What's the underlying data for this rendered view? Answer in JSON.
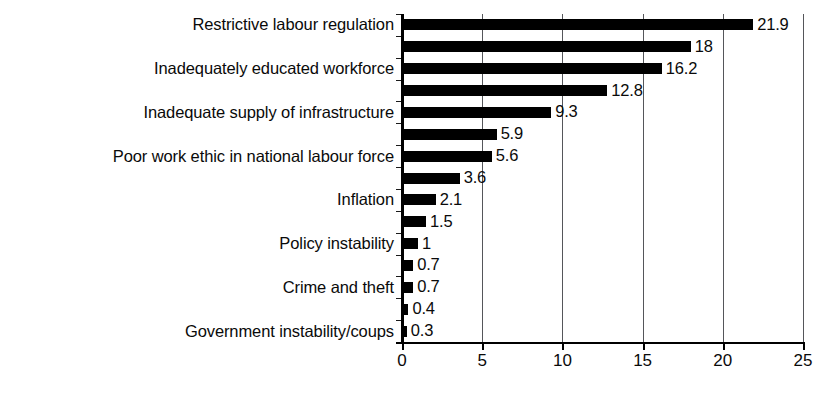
{
  "chart_data": {
    "type": "bar",
    "orientation": "horizontal",
    "title": "",
    "subtitle": "",
    "xlabel": "",
    "ylabel": "",
    "xlim": [
      0,
      25
    ],
    "xticks": [
      0,
      5,
      10,
      15,
      20,
      25
    ],
    "xtick_labels": [
      "0",
      "5",
      "10",
      "15",
      "20",
      "25"
    ],
    "grid": "vertical",
    "legend": "none",
    "bar_color": "#000000",
    "categories": [
      "Restrictive labour regulation",
      "",
      "Inadequately educated workforce",
      "",
      "Inadequate supply of infrastructure",
      "",
      "Poor work ethic in national labour force",
      "",
      "Inflation",
      "",
      "Policy instability",
      "",
      "Crime and theft",
      "",
      "Government instability/coups"
    ],
    "values": [
      21.9,
      18,
      16.2,
      12.8,
      9.3,
      5.9,
      5.6,
      3.6,
      2.1,
      1.5,
      1,
      0.7,
      0.7,
      0.4,
      0.3
    ],
    "value_labels": [
      "21.9",
      "18",
      "16.2",
      "12.8",
      "9.3",
      "5.9",
      "5.6",
      "3.6",
      "2.1",
      "1.5",
      "1",
      "0.7",
      "0.7",
      "0.4",
      "0.3"
    ]
  },
  "visible_category_labels": [
    {
      "index": 0,
      "label": "Restrictive labour regulation"
    },
    {
      "index": 2,
      "label": "Inadequately educated workforce"
    },
    {
      "index": 4,
      "label": "Inadequate supply of infrastructure"
    },
    {
      "index": 6,
      "label": "Poor work ethic in national labour force"
    },
    {
      "index": 8,
      "label": "Inflation"
    },
    {
      "index": 10,
      "label": "Policy instability"
    },
    {
      "index": 12,
      "label": "Crime and theft"
    },
    {
      "index": 14,
      "label": "Government instability/coups"
    }
  ]
}
